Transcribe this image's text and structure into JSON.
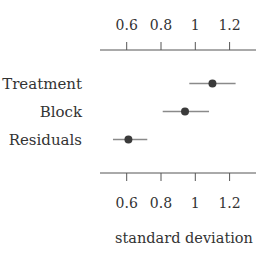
{
  "chart_data": {
    "type": "scatter",
    "subtype": "dot-and-whisker",
    "title": "",
    "xlabel": "standard deviation",
    "ylabel": "",
    "categories": [
      "Treatment",
      "Block",
      "Residuals"
    ],
    "series": [
      {
        "name": "estimate",
        "values": [
          1.1,
          0.94,
          0.61
        ],
        "lower": [
          0.965,
          0.81,
          0.52
        ],
        "upper": [
          1.235,
          1.08,
          0.72
        ]
      }
    ],
    "xticks": [
      0.6,
      0.8,
      1.0,
      1.2
    ],
    "xtick_labels": [
      "0.6",
      "0.8",
      "1",
      "1.2"
    ],
    "xlim": [
      0.445,
      1.36
    ],
    "grid": false,
    "legend": "none",
    "axes": [
      "top",
      "bottom"
    ]
  },
  "colors": {
    "point": "#3a3a3a",
    "whisker": "#8a8a8a",
    "axis": "#555555",
    "text": "#333333"
  }
}
